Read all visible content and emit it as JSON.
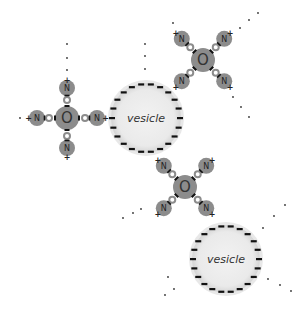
{
  "diagram": {
    "type": "molecular-schematic",
    "colors": {
      "atom_fill": "#8c8c8c",
      "vesicle_fill": "#ececec",
      "vesicle_halo": "#d9d9d9",
      "charge_mark": "#111111",
      "dot": "#333333"
    },
    "vesicles": [
      {
        "id": "vesicle-1",
        "label": "vesicle",
        "surface_charge": "negative"
      },
      {
        "id": "vesicle-2",
        "label": "vesicle",
        "surface_charge": "negative"
      }
    ],
    "molecules": [
      {
        "id": "molecule-left",
        "center_label": "O",
        "arm_labels": [
          "N",
          "N",
          "N",
          "N"
        ],
        "arm_charges": [
          "+",
          "+",
          "+",
          "+"
        ]
      },
      {
        "id": "molecule-top-right",
        "center_label": "O",
        "arm_labels": [
          "N",
          "N",
          "N",
          "N"
        ],
        "arm_charges": [
          "+",
          "+",
          "+",
          "+"
        ]
      },
      {
        "id": "molecule-middle",
        "center_label": "O",
        "arm_labels": [
          "N",
          "N",
          "N",
          "N"
        ],
        "arm_charges": [
          "+",
          "+",
          "+",
          "+"
        ]
      }
    ]
  }
}
